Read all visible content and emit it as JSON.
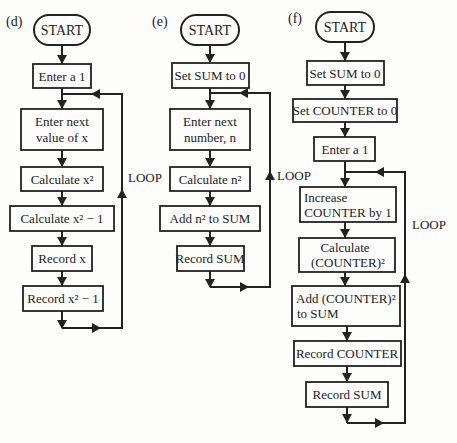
{
  "colors": {
    "ink": "#222222",
    "background": "#fdfdfb"
  },
  "flowcharts": [
    {
      "label": "(d)",
      "start": "START",
      "steps": [
        {
          "lines": [
            "Enter a 1"
          ]
        },
        {
          "lines": [
            "Enter next",
            "value of x"
          ]
        },
        {
          "lines": [
            "Calculate x²"
          ]
        },
        {
          "lines": [
            "Calculate x² − 1"
          ]
        },
        {
          "lines": [
            "Record x"
          ]
        },
        {
          "lines": [
            "Record x² − 1"
          ]
        }
      ],
      "loop_label": "LOOP"
    },
    {
      "label": "(e)",
      "start": "START",
      "steps": [
        {
          "lines": [
            "Set SUM to 0"
          ]
        },
        {
          "lines": [
            "Enter next",
            "number, n"
          ]
        },
        {
          "lines": [
            "Calculate n²"
          ]
        },
        {
          "lines": [
            "Add n²  to SUM"
          ]
        },
        {
          "lines": [
            "Record SUM"
          ]
        }
      ],
      "loop_label": "LOOP"
    },
    {
      "label": "(f)",
      "start": "START",
      "steps": [
        {
          "lines": [
            "Set SUM to 0"
          ]
        },
        {
          "lines": [
            "Set COUNTER to 0"
          ]
        },
        {
          "lines": [
            "Enter a 1"
          ]
        },
        {
          "lines": [
            "Increase",
            "COUNTER by 1"
          ]
        },
        {
          "lines": [
            "Calculate",
            "(COUNTER)²"
          ]
        },
        {
          "lines": [
            "Add (COUNTER)²",
            "to SUM"
          ]
        },
        {
          "lines": [
            "Record COUNTER"
          ]
        },
        {
          "lines": [
            "Record SUM"
          ]
        }
      ],
      "loop_label": "LOOP"
    }
  ]
}
